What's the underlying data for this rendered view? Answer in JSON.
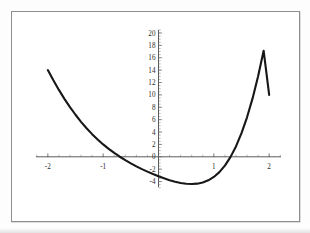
{
  "figure": {
    "background_color": "#ffffff",
    "frame_color": "#8e8e8e",
    "curve_color": "#171717",
    "axis_color": "#4a4a4a"
  },
  "chart_data": {
    "type": "line",
    "title": "",
    "subtitle": "",
    "xlabel": "",
    "ylabel": "",
    "xlim": [
      -2.25,
      2.25
    ],
    "ylim": [
      -5.2,
      20.8
    ],
    "grid": false,
    "legend": null,
    "axes_style": "centered-cross",
    "x_ticks": [
      -2,
      -1,
      0,
      1,
      2
    ],
    "x_tick_labels": [
      "-2",
      "-1",
      "0",
      "1",
      "2"
    ],
    "x_minor_tick_step": 0.2,
    "y_ticks": [
      -4,
      -2,
      0,
      2,
      4,
      6,
      8,
      10,
      12,
      14,
      16,
      18,
      20
    ],
    "y_tick_labels": [
      "-4",
      "-2",
      "0",
      "2",
      "4",
      "6",
      "8",
      "10",
      "12",
      "14",
      "16",
      "18",
      "20"
    ],
    "y_minor_tick_step": 0.5,
    "series": [
      {
        "name": "curve",
        "x": [
          -2.0,
          -1.9,
          -1.8,
          -1.7,
          -1.6,
          -1.5,
          -1.4,
          -1.3,
          -1.2,
          -1.1,
          -1.0,
          -0.9,
          -0.8,
          -0.7,
          -0.6,
          -0.5,
          -0.4,
          -0.3,
          -0.2,
          -0.1,
          0.0,
          0.1,
          0.2,
          0.3,
          0.4,
          0.5,
          0.6,
          0.7,
          0.8,
          0.9,
          1.0,
          1.1,
          1.2,
          1.3,
          1.4,
          1.5,
          1.6,
          1.7,
          1.8,
          1.9,
          2.0
        ],
        "y": [
          14.0,
          12.35,
          10.8,
          9.36,
          8.02,
          6.79,
          5.65,
          4.61,
          3.66,
          2.8,
          2.0,
          1.28,
          0.62,
          0.01,
          -0.54,
          -1.06,
          -1.54,
          -1.99,
          -2.4,
          -2.79,
          -3.15,
          -3.48,
          -3.77,
          -4.02,
          -4.22,
          -4.35,
          -4.4,
          -4.34,
          -4.15,
          -3.8,
          -3.25,
          -2.47,
          -1.42,
          -0.05,
          1.68,
          3.81,
          6.38,
          9.43,
          13.0,
          17.13,
          10.0
        ]
      }
    ],
    "annotations": [],
    "endpoints": {
      "left": {
        "x": -2.0,
        "y": 14.0
      },
      "right": {
        "x": 2.0,
        "y": 10.0
      }
    },
    "minimum": {
      "x": 0.55,
      "y": -4.4
    },
    "x_intercepts": [
      -0.7,
      1.3
    ]
  }
}
